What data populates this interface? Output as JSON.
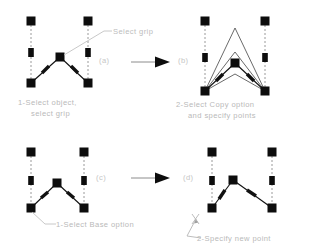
{
  "figure": {
    "background_color": "#ffffff",
    "line_color": "#1a1a1a",
    "grip_color": "#0d0d0d",
    "dashed_color": "#8f8f8f",
    "text_color": "#bdbdbd"
  },
  "panels": [
    {
      "id": "a",
      "label": "(a)",
      "caption_line1": "1-Select object,",
      "caption_line2": "select grip"
    },
    {
      "id": "b",
      "label": "(b)",
      "caption_line1": "2-Select Copy option",
      "caption_line2": "and specify points"
    },
    {
      "id": "c",
      "label": "(c)",
      "caption_line1": "1-Select Base option",
      "caption_line2": ""
    },
    {
      "id": "d",
      "label": "(d)",
      "caption_line1": "2-Specify new point",
      "caption_line2": ""
    }
  ],
  "annotations": {
    "select_grip": "Select grip"
  },
  "ucs_icon": {
    "x_label": "",
    "y_label": ""
  },
  "arrows": [
    {
      "name": "arrow-a-to-b"
    },
    {
      "name": "arrow-c-to-d"
    }
  ]
}
